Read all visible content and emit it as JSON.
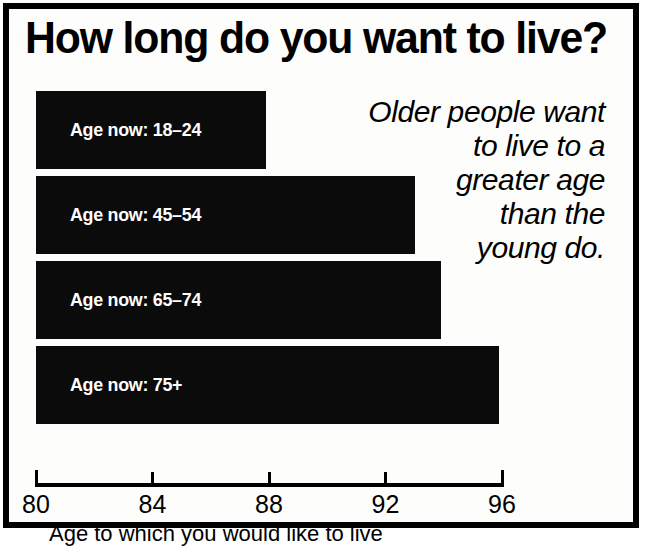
{
  "figure": {
    "title": "How long do you want to live?",
    "annotation_lines": [
      "Older people want",
      "to live to a",
      "greater age",
      "than the",
      "young do."
    ],
    "annotation_text": "Older people want to live to a greater age than the young do.",
    "border_color": "#000000",
    "bar_color": "#0b0b0b",
    "background_color": "#fdfdfb",
    "label_color": "#ffffff"
  },
  "chart_data": {
    "type": "bar",
    "orientation": "horizontal",
    "title": "How long do you want to live?",
    "categories": [
      "Age now: 18–24",
      "Age now: 45–54",
      "Age now: 65–74",
      "Age now: 75+"
    ],
    "values": [
      87.9,
      93.0,
      93.9,
      95.9
    ],
    "xlabel": "Age to which you would like to live",
    "ylabel": "",
    "xlim": [
      80,
      96
    ],
    "xticks": [
      80,
      84,
      88,
      92,
      96
    ],
    "xtick_labels": [
      "80",
      "84",
      "88",
      "92",
      "96"
    ],
    "grid": false,
    "legend": false,
    "annotation": "Older people want to live to a greater age than the young do."
  }
}
